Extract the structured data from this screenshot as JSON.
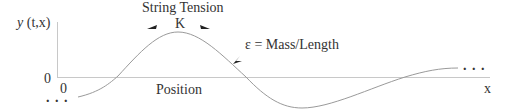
{
  "diagram": {
    "title": "String Tension",
    "tension_symbol": "K",
    "density_label": "ε = Mass/Length",
    "y_axis_label_y": "y",
    "y_axis_label_args": "(t,x)",
    "y_origin_label": "0",
    "x_origin_label": "0",
    "x_axis_caption": "Position",
    "x_axis_label": "x",
    "left_ellipsis": ". . .",
    "right_ellipsis": ". . .",
    "colors": {
      "axis": "#c8c8c8",
      "curve": "#9a9a9a",
      "arrow": "#222222",
      "text": "#333333"
    }
  }
}
